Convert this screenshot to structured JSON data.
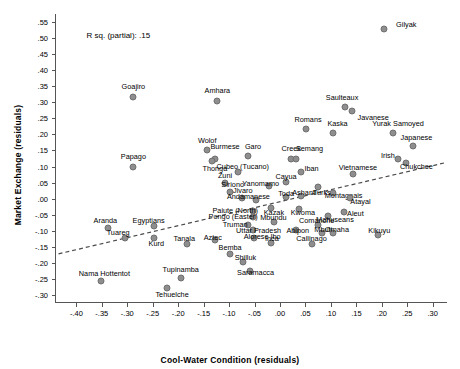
{
  "axes": {
    "x_title": "Cool-Water Condition (residuals)",
    "y_title": "Market Exchange (residuals)"
  },
  "annotation": {
    "rsq": "R sq. (partial): .15"
  },
  "style": {
    "marker_fill": "#8e8e8e",
    "marker_stroke": "#6f6f6f",
    "axis_color": "#555555",
    "background": "#ffffff",
    "fit_line_color": "#4a4a4a"
  },
  "chart_data": {
    "type": "scatter",
    "title": "",
    "xlabel": "Cool-Water Condition (residuals)",
    "ylabel": "Market Exchange (residuals)",
    "xlim": [
      -0.44,
      0.33
    ],
    "ylim": [
      -0.325,
      0.575
    ],
    "grid": false,
    "legend": null,
    "xticks": [
      "-.40",
      "-.35",
      "-.30",
      "-.25",
      "-.20",
      "-.15",
      "-.10",
      "-.05",
      ".00",
      ".05",
      ".10",
      ".15",
      ".20",
      ".25",
      ".30"
    ],
    "xtickvals": [
      -0.4,
      -0.35,
      -0.3,
      -0.25,
      -0.2,
      -0.15,
      -0.1,
      -0.05,
      0.0,
      0.05,
      0.1,
      0.15,
      0.2,
      0.25,
      0.3
    ],
    "yticks": [
      ".55",
      ".50",
      ".45",
      ".40",
      ".35",
      ".30",
      ".25",
      ".20",
      ".15",
      ".10",
      ".05",
      ".00",
      "-.05",
      "-.10",
      "-.15",
      "-.20",
      "-.25",
      "-.30"
    ],
    "ytickvals": [
      0.55,
      0.5,
      0.45,
      0.4,
      0.35,
      0.3,
      0.25,
      0.2,
      0.15,
      0.1,
      0.05,
      0.0,
      -0.05,
      -0.1,
      -0.15,
      -0.2,
      -0.25,
      -0.3
    ],
    "annotations": [
      "R sq. (partial): .15"
    ],
    "fit_line": {
      "style": "dashed",
      "x": [
        -0.435,
        0.325
      ],
      "y": [
        -0.172,
        0.112
      ]
    },
    "points": [
      {
        "label": "Gilyak",
        "x": 0.205,
        "y": 0.528,
        "lx": 0.248,
        "ly": 0.545
      },
      {
        "label": "Goajiro",
        "x": -0.288,
        "y": 0.318,
        "lx": -0.288,
        "ly": 0.352
      },
      {
        "label": "Amhara",
        "x": -0.123,
        "y": 0.305,
        "lx": -0.123,
        "ly": 0.338
      },
      {
        "label": "Saulteaux",
        "x": 0.128,
        "y": 0.285,
        "lx": 0.122,
        "ly": 0.318
      },
      {
        "label": "Javanese",
        "x": 0.142,
        "y": 0.272,
        "lx": 0.183,
        "ly": 0.255
      },
      {
        "label": "Romans",
        "x": 0.052,
        "y": 0.218,
        "lx": 0.055,
        "ly": 0.248
      },
      {
        "label": "Kaska",
        "x": 0.105,
        "y": 0.205,
        "lx": 0.113,
        "ly": 0.235
      },
      {
        "label": "Yurak Samoyed",
        "x": 0.222,
        "y": 0.205,
        "lx": 0.232,
        "ly": 0.237
      },
      {
        "label": "Japanese",
        "x": 0.262,
        "y": 0.165,
        "lx": 0.268,
        "ly": 0.193
      },
      {
        "label": "Wolof",
        "x": -0.143,
        "y": 0.152,
        "lx": -0.143,
        "ly": 0.182
      },
      {
        "label": "Burmese",
        "x": -0.128,
        "y": 0.122,
        "lx": -0.108,
        "ly": 0.163
      },
      {
        "label": "Garo",
        "x": -0.062,
        "y": 0.133,
        "lx": -0.053,
        "ly": 0.163
      },
      {
        "label": "Creek",
        "x": 0.022,
        "y": 0.125,
        "lx": 0.022,
        "ly": 0.157
      },
      {
        "label": "Semang",
        "x": 0.032,
        "y": 0.125,
        "lx": 0.058,
        "ly": 0.157
      },
      {
        "label": "Irish",
        "x": 0.232,
        "y": 0.122,
        "lx": 0.212,
        "ly": 0.135
      },
      {
        "label": "Chukchee",
        "x": 0.248,
        "y": 0.112,
        "lx": 0.268,
        "ly": 0.103
      },
      {
        "label": "Papago",
        "x": -0.288,
        "y": 0.098,
        "lx": -0.288,
        "ly": 0.133
      },
      {
        "label": "Thonga",
        "x": -0.133,
        "y": 0.118,
        "lx": -0.128,
        "ly": 0.095
      },
      {
        "label": "Cubeo (Tucano)",
        "x": -0.083,
        "y": 0.083,
        "lx": -0.073,
        "ly": 0.102
      },
      {
        "label": "Iban",
        "x": 0.042,
        "y": 0.082,
        "lx": 0.062,
        "ly": 0.095
      },
      {
        "label": "Vietnamese",
        "x": 0.143,
        "y": 0.078,
        "lx": 0.153,
        "ly": 0.098
      },
      {
        "label": "Zuni",
        "x": -0.108,
        "y": 0.048,
        "lx": -0.108,
        "ly": 0.075
      },
      {
        "label": "Cayua",
        "x": 0.012,
        "y": 0.052,
        "lx": 0.012,
        "ly": 0.072
      },
      {
        "label": "Yanomamo",
        "x": -0.022,
        "y": 0.038,
        "lx": -0.038,
        "ly": 0.048
      },
      {
        "label": "Siriono",
        "x": -0.098,
        "y": 0.022,
        "lx": -0.093,
        "ly": 0.045
      },
      {
        "label": "Turks",
        "x": 0.075,
        "y": 0.035,
        "lx": 0.082,
        "ly": 0.022
      },
      {
        "label": "Montagnais",
        "x": 0.105,
        "y": 0.018,
        "lx": 0.125,
        "ly": 0.012
      },
      {
        "label": "Jivaro",
        "x": -0.075,
        "y": 0.003,
        "lx": -0.073,
        "ly": 0.028
      },
      {
        "label": "Toda",
        "x": 0.012,
        "y": 0.005,
        "lx": 0.012,
        "ly": 0.018
      },
      {
        "label": "Ashanti",
        "x": 0.042,
        "y": 0.008,
        "lx": 0.048,
        "ly": 0.022
      },
      {
        "label": "Andamanese",
        "x": -0.048,
        "y": -0.005,
        "lx": -0.062,
        "ly": 0.008
      },
      {
        "label": "Atayal",
        "x": 0.138,
        "y": 0.003,
        "lx": 0.158,
        "ly": -0.008
      },
      {
        "label": "Paiute (North)",
        "x": -0.053,
        "y": -0.038,
        "lx": -0.088,
        "ly": -0.035
      },
      {
        "label": "Kazak",
        "x": -0.018,
        "y": -0.028,
        "lx": -0.012,
        "ly": -0.042
      },
      {
        "label": "Kwoma",
        "x": 0.038,
        "y": -0.032,
        "lx": 0.045,
        "ly": -0.042
      },
      {
        "label": "Aleut",
        "x": 0.125,
        "y": -0.042,
        "lx": 0.148,
        "ly": -0.045
      },
      {
        "label": "Pongo (Easter)",
        "x": -0.053,
        "y": -0.058,
        "lx": -0.092,
        "ly": -0.055
      },
      {
        "label": "Mahuseans",
        "x": 0.095,
        "y": -0.055,
        "lx": 0.108,
        "ly": -0.062
      },
      {
        "label": "Mbundu",
        "x": -0.012,
        "y": -0.072,
        "lx": -0.013,
        "ly": -0.058
      },
      {
        "label": "Aranda",
        "x": -0.338,
        "y": -0.092,
        "lx": -0.343,
        "ly": -0.068
      },
      {
        "label": "Egyptians",
        "x": -0.248,
        "y": -0.085,
        "lx": -0.258,
        "ly": -0.068
      },
      {
        "label": "Truman",
        "x": -0.063,
        "y": -0.082,
        "lx": -0.088,
        "ly": -0.078
      },
      {
        "label": "Comanche",
        "x": 0.075,
        "y": -0.082,
        "lx": 0.072,
        "ly": -0.068
      },
      {
        "label": "Tuareg",
        "x": -0.305,
        "y": -0.122,
        "lx": -0.318,
        "ly": -0.105
      },
      {
        "label": "Kurd",
        "x": -0.248,
        "y": -0.122,
        "lx": -0.243,
        "ly": -0.138
      },
      {
        "label": "Uttar Pradesh",
        "x": -0.053,
        "y": -0.098,
        "lx": -0.042,
        "ly": -0.098
      },
      {
        "label": "Abipon",
        "x": 0.032,
        "y": -0.098,
        "lx": 0.035,
        "ly": -0.098
      },
      {
        "label": "Mbuti",
        "x": 0.082,
        "y": -0.108,
        "lx": 0.085,
        "ly": -0.095
      },
      {
        "label": "Omaha",
        "x": 0.105,
        "y": -0.108,
        "lx": 0.112,
        "ly": -0.095
      },
      {
        "label": "Kikuyu",
        "x": 0.192,
        "y": -0.112,
        "lx": 0.195,
        "ly": -0.098
      },
      {
        "label": "Tanala",
        "x": -0.182,
        "y": -0.142,
        "lx": -0.188,
        "ly": -0.122
      },
      {
        "label": "Aztec",
        "x": -0.128,
        "y": -0.128,
        "lx": -0.132,
        "ly": -0.118
      },
      {
        "label": "Alorese Ibo",
        "x": -0.052,
        "y": -0.122,
        "lx": -0.035,
        "ly": -0.115
      },
      {
        "label": "Inca",
        "x": -0.018,
        "y": -0.138,
        "lx": -0.016,
        "ly": -0.122
      },
      {
        "label": "Callinago",
        "x": 0.062,
        "y": -0.142,
        "lx": 0.062,
        "ly": -0.122
      },
      {
        "label": "Bemba",
        "x": -0.098,
        "y": -0.172,
        "lx": -0.098,
        "ly": -0.152
      },
      {
        "label": "Shilluk",
        "x": -0.072,
        "y": -0.198,
        "lx": -0.068,
        "ly": -0.182
      },
      {
        "label": "Saramacca",
        "x": -0.058,
        "y": -0.225,
        "lx": -0.048,
        "ly": -0.228
      },
      {
        "label": "Tupinamba",
        "x": -0.195,
        "y": -0.248,
        "lx": -0.195,
        "ly": -0.218
      },
      {
        "label": "Nama Hottentot",
        "x": -0.352,
        "y": -0.258,
        "lx": -0.345,
        "ly": -0.232
      },
      {
        "label": "Tehuelche",
        "x": -0.222,
        "y": -0.278,
        "lx": -0.212,
        "ly": -0.298
      }
    ]
  }
}
